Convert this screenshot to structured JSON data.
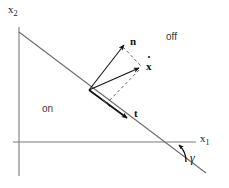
{
  "figure": {
    "kind": "switching-surface-vector-diagram",
    "axes": {
      "y_axis_label": "x",
      "y_axis_subscript": "2",
      "x_axis_label": "x",
      "x_axis_subscript": "1"
    },
    "regions": [
      {
        "name": "on-region",
        "label": "on"
      },
      {
        "name": "off-region",
        "label": "off"
      }
    ],
    "vectors": [
      {
        "name": "normal-vector",
        "label": "n"
      },
      {
        "name": "state-velocity-vector",
        "label": "x",
        "accent": "dot"
      },
      {
        "name": "tangent-vector",
        "label": "t"
      }
    ],
    "angle": {
      "name": "gamma-angle",
      "label": "γ"
    },
    "colors": {
      "line": "#555555",
      "axis": "#777777",
      "vector": "#111111",
      "text": "#1a1a1a",
      "background": "#ffffff"
    }
  }
}
